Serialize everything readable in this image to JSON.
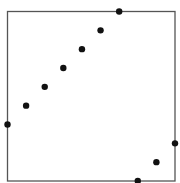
{
  "chart_data": {
    "type": "scatter",
    "title": "",
    "xlabel": "",
    "ylabel": "",
    "xlim": [
      0,
      9
    ],
    "ylim": [
      0,
      9
    ],
    "grid": false,
    "legend": "none",
    "frame": true,
    "point_color": "#111111",
    "frame_color": "#555555",
    "points": [
      {
        "x": 0,
        "y": 3
      },
      {
        "x": 1,
        "y": 4
      },
      {
        "x": 2,
        "y": 5
      },
      {
        "x": 3,
        "y": 6
      },
      {
        "x": 4,
        "y": 7
      },
      {
        "x": 5,
        "y": 8
      },
      {
        "x": 6,
        "y": 9
      },
      {
        "x": 7,
        "y": 0
      },
      {
        "x": 8,
        "y": 1
      },
      {
        "x": 9,
        "y": 2
      }
    ]
  }
}
